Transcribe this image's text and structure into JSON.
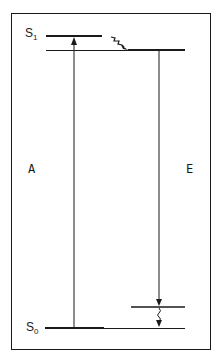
{
  "diagram": {
    "type": "Jablonski energy-level diagram",
    "states": [
      {
        "symbol": "S",
        "subscript": "1",
        "role": "excited singlet state"
      },
      {
        "symbol": "S",
        "subscript": "0",
        "role": "ground singlet state"
      }
    ],
    "transitions": [
      {
        "label": "A",
        "meaning": "absorption",
        "from": "S0",
        "to": "S1 upper vibrational level"
      },
      {
        "label": "E",
        "meaning": "emission",
        "from": "S1 lowest vibrational level",
        "to": "S0 upper vibrational level"
      }
    ],
    "relaxation": [
      {
        "type": "wavy",
        "location": "within S1"
      },
      {
        "type": "wavy",
        "location": "within S0"
      }
    ],
    "colors": {
      "line": "#1a1a1a",
      "background": "#ffffff"
    }
  },
  "labels": {
    "s1_main": "S",
    "s1_sub": "1",
    "s0_main": "S",
    "s0_sub": "0",
    "absorption": "A",
    "emission": "E"
  }
}
